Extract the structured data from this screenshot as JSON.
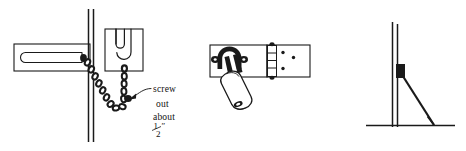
{
  "figure": {
    "background_color": "#ffffff",
    "ink_color": "#1a1a1a",
    "width": 466,
    "height": 151
  },
  "annotation": {
    "line1": "screw",
    "line2": "out",
    "line3": "about",
    "fraction_numerator": "1",
    "fraction_denominator": "2",
    "unit_mark": "″",
    "full_text": "screw out about ½″"
  },
  "panels": [
    {
      "id": "panel-chain-lock",
      "name": "chain-lock-assembly",
      "parts": [
        "slide-plate-with-slot",
        "door-jamb",
        "security-chain",
        "u-slot-keeper-plate",
        "mounting-screw",
        "callout-arrow"
      ]
    },
    {
      "id": "panel-hasp-padlock",
      "name": "hasp-and-padlock-assembly",
      "parts": [
        "hasp-plate",
        "hasp-staple",
        "padlock-body",
        "padlock-shackle",
        "hinge-knuckles",
        "screw-holes"
      ]
    },
    {
      "id": "panel-braced-post",
      "name": "braced-post-assembly",
      "parts": [
        "vertical-post",
        "bracket-block",
        "diagonal-brace",
        "ground-line"
      ]
    }
  ]
}
